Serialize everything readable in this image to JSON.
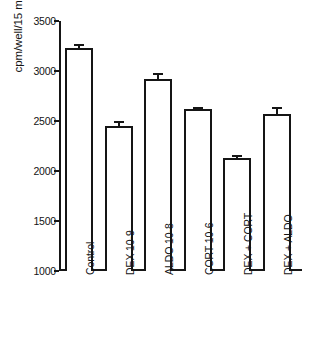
{
  "chart_data": {
    "type": "bar",
    "title": "",
    "xlabel": "",
    "ylabel": "cpm/well/15 min",
    "ylim": [
      1000,
      3500
    ],
    "yticks": [
      1000,
      1500,
      2000,
      2500,
      3000,
      3500
    ],
    "ytick_labels": [
      "1000",
      "1500",
      "2000",
      "2500",
      "3000",
      "3500"
    ],
    "grid": false,
    "legend": false,
    "bar_fill_color": "#ffffff",
    "bar_edge_color": "#151515",
    "categories": [
      "Control",
      "DEX 10-9",
      "ALDO 10-8",
      "CORT 10-6",
      "DEX + CORT",
      "DEX + ALDO"
    ],
    "values": [
      3230,
      2450,
      2920,
      2620,
      2130,
      2575
    ],
    "errors": [
      45,
      55,
      65,
      20,
      30,
      70
    ]
  }
}
